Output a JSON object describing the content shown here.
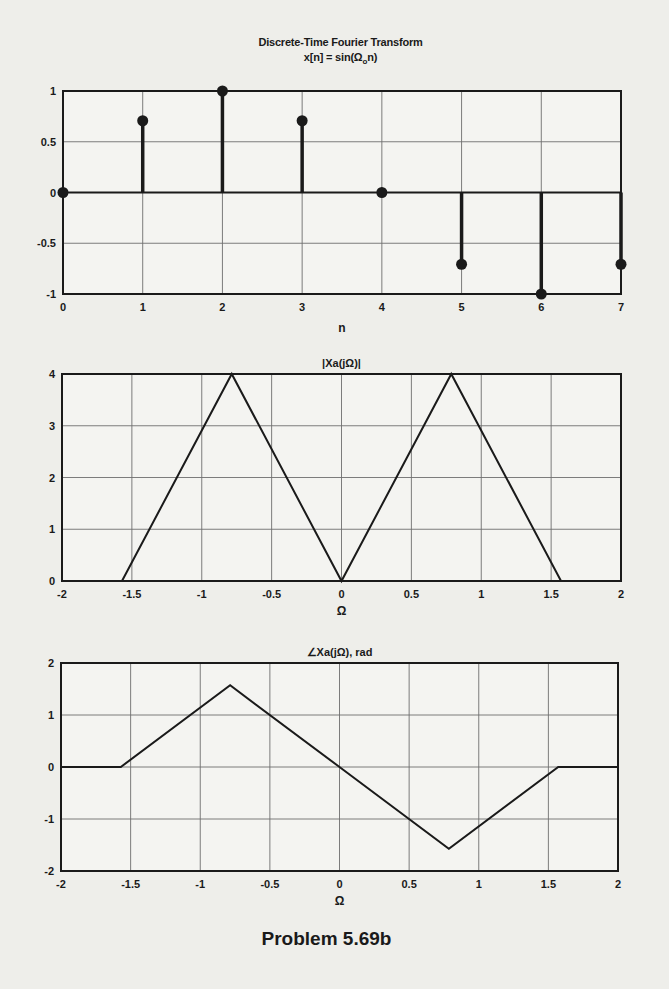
{
  "figure": {
    "title_line1": "Discrete-Time Fourier Transform",
    "title_line2_pre": "x[n] = sin(Ω",
    "title_line2_sub": "o",
    "title_line2_post": "n)",
    "footer": "Problem 5.69b"
  },
  "chart_data": [
    {
      "type": "stem",
      "title": "Discrete-Time Fourier Transform / x[n] = sin(Ω_o n)",
      "xlabel": "n",
      "ylabel": "",
      "xlim": [
        0,
        7
      ],
      "ylim": [
        -1,
        1
      ],
      "xticks": [
        0,
        1,
        2,
        3,
        4,
        5,
        6,
        7
      ],
      "xtick_labels": [
        "0",
        "1",
        "2",
        "3",
        "4",
        "5",
        "6",
        "7"
      ],
      "yticks": [
        -1,
        -0.5,
        0,
        0.5,
        1
      ],
      "ytick_labels": [
        "-1",
        "-0.5",
        "0",
        "0.5",
        "1"
      ],
      "grid": true,
      "x": [
        0,
        1,
        2,
        3,
        4,
        5,
        6,
        7
      ],
      "values": [
        0,
        0.707,
        1,
        0.707,
        0,
        -0.707,
        -1,
        -0.707
      ],
      "frame": {
        "left": 63,
        "top": 91,
        "right": 621,
        "bottom": 294
      }
    },
    {
      "type": "line",
      "title": "|Xa(jΩ)|",
      "xlabel": "Ω",
      "ylabel": "",
      "xlim": [
        -2,
        2
      ],
      "ylim": [
        0,
        4
      ],
      "xticks": [
        -2,
        -1.5,
        -1,
        -0.5,
        0,
        0.5,
        1,
        1.5,
        2
      ],
      "xtick_labels": [
        "-2",
        "-1.5",
        "-1",
        "-0.5",
        "0",
        "0.5",
        "1",
        "1.5",
        "2"
      ],
      "yticks": [
        0,
        1,
        2,
        3,
        4
      ],
      "ytick_labels": [
        "0",
        "1",
        "2",
        "3",
        "4"
      ],
      "grid": true,
      "x": [
        -2,
        -1.5708,
        -0.7854,
        0,
        0.7854,
        1.5708,
        2
      ],
      "values": [
        0,
        0,
        4,
        0,
        4,
        0,
        0
      ],
      "frame": {
        "left": 62,
        "top": 374,
        "right": 621,
        "bottom": 581
      }
    },
    {
      "type": "line",
      "title": "∠Xa(jΩ), rad",
      "xlabel": "Ω",
      "ylabel": "",
      "xlim": [
        -2,
        2
      ],
      "ylim": [
        -2,
        2
      ],
      "xticks": [
        -2,
        -1.5,
        -1,
        -0.5,
        0,
        0.5,
        1,
        1.5,
        2
      ],
      "xtick_labels": [
        "-2",
        "-1.5",
        "-1",
        "-0.5",
        "0",
        "0.5",
        "1",
        "1.5",
        "2"
      ],
      "yticks": [
        -2,
        -1,
        0,
        1,
        2
      ],
      "ytick_labels": [
        "-2",
        "-1",
        "0",
        "1",
        "2"
      ],
      "grid": true,
      "x": [
        -2,
        -1.5708,
        -0.7854,
        0,
        0.7854,
        1.5708,
        2
      ],
      "values": [
        0,
        0,
        1.5708,
        0,
        -1.5708,
        0,
        0
      ],
      "frame": {
        "left": 61,
        "top": 663,
        "right": 618,
        "bottom": 871
      }
    }
  ],
  "colors": {
    "background": "#eeeeea",
    "axes_bg": "#f4f4f1",
    "ink": "#1a1a1a",
    "grid": "#6e6e6e"
  }
}
